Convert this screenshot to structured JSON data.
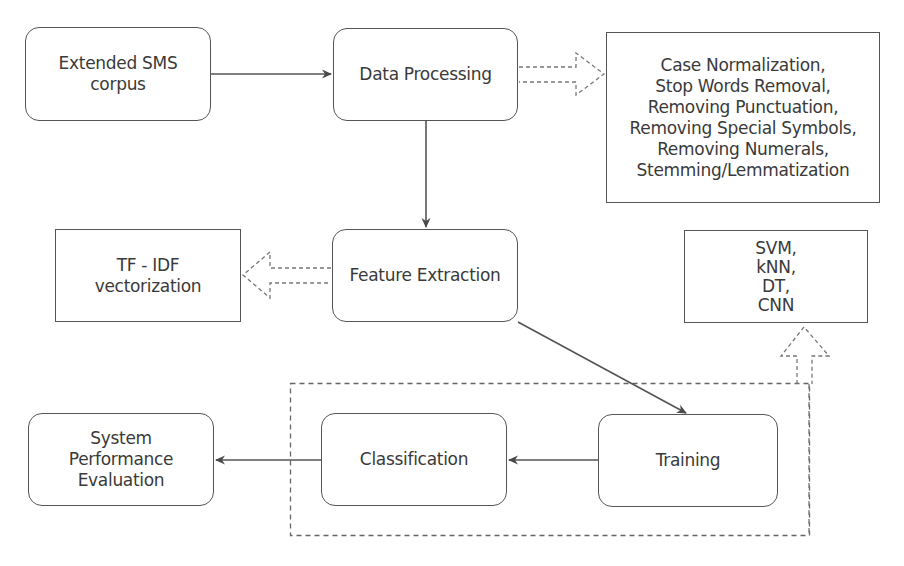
{
  "diagram": {
    "type": "flowchart",
    "nodes": {
      "corpus": {
        "label": "Extended SMS\ncorpus",
        "shape": "rounded"
      },
      "data_processing": {
        "label": "Data Processing",
        "shape": "rounded"
      },
      "preprocessing_steps": {
        "label": "Case Normalization,\nStop Words Removal,\nRemoving Punctuation,\nRemoving Special Symbols,\nRemoving Numerals,\nStemming/Lemmatization",
        "shape": "rectangle"
      },
      "feature_extraction": {
        "label": "Feature Extraction",
        "shape": "rounded"
      },
      "tfidf": {
        "label": "TF - IDF\nvectorization",
        "shape": "rectangle"
      },
      "classifiers": {
        "label": "SVM,\nkNN,\nDT,\nCNN",
        "shape": "rectangle"
      },
      "training": {
        "label": "Training",
        "shape": "rounded"
      },
      "classification": {
        "label": "Classification",
        "shape": "rounded"
      },
      "evaluation": {
        "label": "System\nPerformance\nEvaluation",
        "shape": "rounded"
      }
    },
    "edges": [
      {
        "from": "corpus",
        "to": "data_processing",
        "style": "solid"
      },
      {
        "from": "data_processing",
        "to": "preprocessing_steps",
        "style": "dashed-hollow"
      },
      {
        "from": "data_processing",
        "to": "feature_extraction",
        "style": "solid"
      },
      {
        "from": "feature_extraction",
        "to": "tfidf",
        "style": "dashed-hollow"
      },
      {
        "from": "feature_extraction",
        "to": "training",
        "style": "solid"
      },
      {
        "from": "training",
        "to": "classification",
        "style": "solid"
      },
      {
        "from": "classification",
        "to": "evaluation",
        "style": "solid"
      },
      {
        "from": "training_group",
        "to": "classifiers",
        "style": "dashed-hollow"
      }
    ],
    "groups": [
      {
        "id": "training_group",
        "members": [
          "classification",
          "training"
        ],
        "style": "dashed"
      }
    ],
    "colors": {
      "stroke": "#555555",
      "dashed": "#777777",
      "text": "#3a3a3a",
      "background": "#ffffff"
    }
  }
}
